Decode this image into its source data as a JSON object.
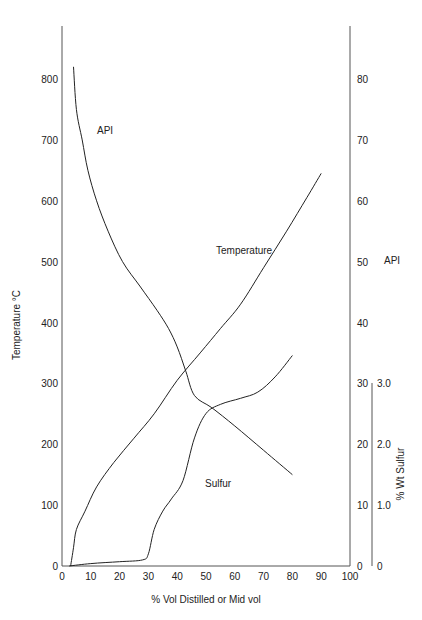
{
  "chart_data": {
    "type": "line",
    "title": "",
    "xlabel": "% Vol Distilled or Mid vol",
    "xlim": [
      0,
      100
    ],
    "x_ticks": [
      "0",
      "10",
      "20",
      "30",
      "40",
      "50",
      "60",
      "70",
      "80",
      "90",
      "100"
    ],
    "axes": {
      "left": {
        "label": "Temperature °C",
        "range": [
          0,
          800
        ],
        "ticks": [
          "0",
          "100",
          "200",
          "300",
          "400",
          "500",
          "600",
          "700",
          "800"
        ]
      },
      "right_api": {
        "label": "API",
        "range": [
          0,
          80
        ],
        "ticks": [
          "0",
          "10",
          "20",
          "30",
          "40",
          "50",
          "60",
          "70",
          "80"
        ]
      },
      "right_sulfur": {
        "label": "% Wt Sulfur",
        "range": [
          0,
          3.0
        ],
        "ticks": [
          "0",
          "1.0",
          "2.0",
          "3.0"
        ]
      }
    },
    "grid": false,
    "legend": "inline curve labels",
    "series": [
      {
        "name": "Temperature",
        "axis": "left",
        "x": [
          3,
          4,
          5,
          8,
          12,
          18,
          25,
          32,
          40,
          48,
          55,
          62,
          70,
          78,
          85,
          90
        ],
        "y": [
          0,
          30,
          60,
          90,
          130,
          170,
          210,
          250,
          305,
          350,
          390,
          430,
          490,
          550,
          605,
          645
        ]
      },
      {
        "name": "API",
        "axis": "right_api",
        "x": [
          4,
          5,
          7,
          9,
          12,
          16,
          21,
          27,
          33,
          37,
          40,
          43,
          46,
          52,
          60,
          70,
          80
        ],
        "y": [
          82,
          75,
          70,
          65,
          60,
          55,
          50,
          46,
          42,
          39,
          36,
          32,
          28,
          26,
          23,
          19,
          15
        ]
      },
      {
        "name": "Sulfur",
        "axis": "right_sulfur",
        "x": [
          2.5,
          10,
          20,
          28,
          30,
          32,
          35,
          38,
          42,
          46,
          50,
          55,
          62,
          68,
          74,
          80
        ],
        "y": [
          0,
          0.04,
          0.07,
          0.1,
          0.2,
          0.6,
          0.9,
          1.1,
          1.4,
          2.1,
          2.5,
          2.65,
          2.75,
          2.85,
          3.1,
          3.45
        ]
      }
    ],
    "annotations": [
      {
        "text": "API",
        "near": "API curve, upper left"
      },
      {
        "text": "Temperature",
        "near": "Temperature curve, upper right"
      },
      {
        "text": "Sulfur",
        "near": "Sulfur curve, lower middle"
      }
    ]
  },
  "labels": {
    "x_axis": "% Vol Distilled or Mid vol",
    "left_axis": "Temperature °C",
    "right_api_axis": "API",
    "right_sulfur_axis": "% Wt Sulfur",
    "curve_api": "API",
    "curve_temperature": "Temperature",
    "curve_sulfur": "Sulfur"
  },
  "colors": {
    "line": "#222222",
    "axis": "#555555",
    "background": "#ffffff"
  }
}
